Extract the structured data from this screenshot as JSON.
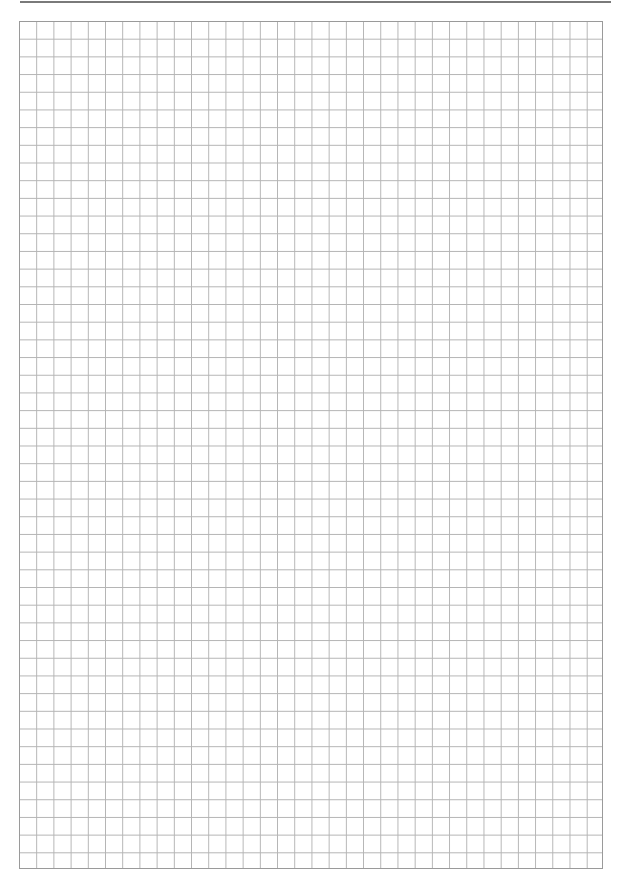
{
  "page": {
    "type": "graph-paper",
    "header": {
      "rule": true,
      "partial_glyph": "y"
    },
    "grid": {
      "columns": 34,
      "rows": 48,
      "line_color": "#b4b4b4",
      "border_color": "#9a9a9a",
      "background": "#ffffff"
    }
  }
}
